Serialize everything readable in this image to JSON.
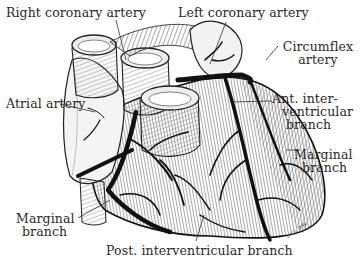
{
  "diagram": {
    "labels": {
      "right_coronary": "Right coronary artery",
      "left_coronary": "Left coronary artery",
      "circumflex_1": "Circumflex",
      "circumflex_2": "artery",
      "atrial": "Atrial artery",
      "ant_inter_1": "Ant. inter-",
      "ant_inter_2": "ventricular",
      "ant_inter_3": "branch",
      "marginal_right_1": "Marginal",
      "marginal_right_2": "branch",
      "marginal_left_1": "Marginal",
      "marginal_left_2": "branch",
      "post_inter": "Post. interventricular branch"
    },
    "signature": "L.C.L. D'W.",
    "colors": {
      "ink": "#111111",
      "text": "#2a2a2a",
      "background": "#fefefe",
      "shade": "#8a8a8a"
    }
  }
}
